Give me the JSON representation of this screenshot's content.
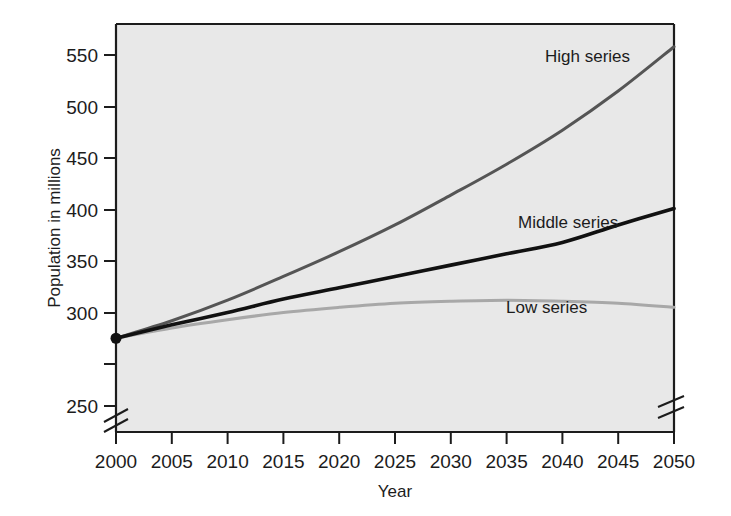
{
  "chart_data": {
    "type": "line",
    "title": "",
    "xlabel": "Year",
    "ylabel": "Population in millions",
    "xlim": [
      2000,
      2050
    ],
    "ylim": [
      250,
      570
    ],
    "xticks": [
      "2000",
      "2005",
      "2010",
      "2015",
      "2020",
      "2025",
      "2030",
      "2035",
      "2040",
      "2045",
      "2050"
    ],
    "yticks": [
      "250",
      "300",
      "350",
      "400",
      "450",
      "500",
      "550"
    ],
    "grid": false,
    "legend_position": "inline-annotations",
    "axis_breaks": [
      "y-axis below 250",
      "x-axis right of 2045"
    ],
    "x": [
      2000,
      2005,
      2010,
      2015,
      2020,
      2025,
      2030,
      2035,
      2040,
      2045,
      2050
    ],
    "series": [
      {
        "name": "High series",
        "color": "#555555",
        "values": [
          275,
          292,
          312,
          335,
          359,
          385,
          414,
          444,
          477,
          515,
          558
        ]
      },
      {
        "name": "Middle series",
        "color": "#111111",
        "values": [
          275,
          288,
          300,
          313,
          324,
          335,
          346,
          357,
          368,
          385,
          401
        ]
      },
      {
        "name": "Low series",
        "color": "#a8a8a8",
        "values": [
          275,
          285,
          293,
          300,
          305,
          309,
          311,
          312,
          311,
          309,
          305
        ]
      }
    ],
    "marker_point": {
      "x": 2000,
      "y": 275,
      "shape": "filled-circle"
    }
  },
  "annotations": {
    "high_label": "High series",
    "middle_label": "Middle series",
    "low_label": "Low series"
  },
  "colors": {
    "plot_background": "#e8e8e8",
    "page_background": "#ffffff",
    "axis": "#1c1c1c",
    "high": "#555555",
    "middle": "#111111",
    "low": "#a8a8a8"
  }
}
